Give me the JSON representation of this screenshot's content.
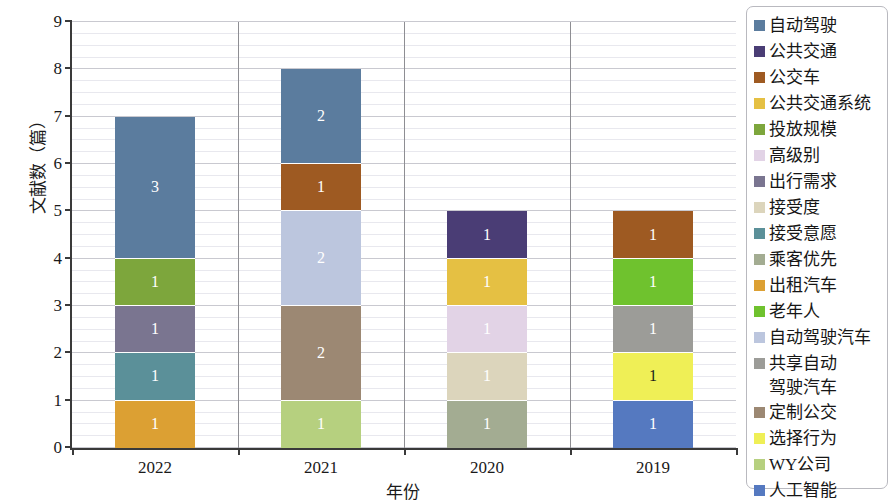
{
  "chart_data": {
    "type": "bar",
    "subtype": "stacked-bar",
    "title": "",
    "xlabel": "年份",
    "ylabel": "文献数（篇）",
    "categories": [
      "2022",
      "2021",
      "2020",
      "2019"
    ],
    "ylim": [
      0,
      9
    ],
    "ytick_labels": [
      "0",
      "1",
      "2",
      "3",
      "4",
      "5",
      "6",
      "7",
      "8",
      "9"
    ],
    "ytick_values": [
      0,
      1,
      2,
      3,
      4,
      5,
      6,
      7,
      8,
      9
    ],
    "grid": true,
    "minor_grid": true,
    "legend_position": "right",
    "totals": [
      7,
      8,
      5,
      5
    ],
    "series": [
      {
        "name": "自动驾驶",
        "color": "#5B7C9E",
        "values": [
          3,
          2,
          0,
          0
        ]
      },
      {
        "name": "公共交通",
        "color": "#4A3D75",
        "values": [
          0,
          0,
          1,
          0
        ]
      },
      {
        "name": "公交车",
        "color": "#9E5A22",
        "values": [
          0,
          1,
          0,
          1
        ]
      },
      {
        "name": "公共交通系统",
        "color": "#E5C043",
        "values": [
          0,
          0,
          1,
          0
        ]
      },
      {
        "name": "投放规模",
        "color": "#7DA63C",
        "values": [
          1,
          0,
          0,
          0
        ]
      },
      {
        "name": "高级别",
        "color": "#E2D3E6",
        "values": [
          0,
          0,
          1,
          0
        ]
      },
      {
        "name": "出行需求",
        "color": "#7A7590",
        "values": [
          1,
          0,
          0,
          0
        ]
      },
      {
        "name": "接受度",
        "color": "#DCD5BC",
        "values": [
          0,
          0,
          1,
          0
        ]
      },
      {
        "name": "接受意愿",
        "color": "#5B9099",
        "values": [
          1,
          0,
          0,
          0
        ]
      },
      {
        "name": "乘客优先",
        "color": "#A3AC92",
        "values": [
          0,
          0,
          1,
          0
        ]
      },
      {
        "name": "出租汽车",
        "color": "#DCA033",
        "values": [
          1,
          0,
          0,
          0
        ]
      },
      {
        "name": "老年人",
        "color": "#6FC22E",
        "values": [
          0,
          0,
          0,
          1
        ]
      },
      {
        "name": "自动驾驶汽车",
        "color": "#BCC6DE",
        "values": [
          0,
          2,
          0,
          0
        ]
      },
      {
        "name": "共享自动\n驾驶汽车",
        "color": "#9C9C98",
        "values": [
          0,
          0,
          0,
          1
        ]
      },
      {
        "name": "定制公交",
        "color": "#9C8873",
        "values": [
          0,
          2,
          0,
          0
        ]
      },
      {
        "name": "选择行为",
        "color": "#EFEF56",
        "values": [
          0,
          0,
          0,
          1
        ]
      },
      {
        "name": "WY公司",
        "color": "#B6D07F",
        "values": [
          0,
          1,
          0,
          0
        ]
      },
      {
        "name": "人工智能",
        "color": "#5579C0",
        "values": [
          0,
          0,
          0,
          1
        ]
      }
    ],
    "stacks": [
      {
        "category": "2022",
        "segments": [
          {
            "label": "1",
            "value": 1,
            "series": "出租汽车",
            "color": "#DCA033",
            "text_color": "#ffffff"
          },
          {
            "label": "1",
            "value": 1,
            "series": "接受意愿",
            "color": "#5B9099",
            "text_color": "#ffffff"
          },
          {
            "label": "1",
            "value": 1,
            "series": "出行需求",
            "color": "#7A7590",
            "text_color": "#ffffff"
          },
          {
            "label": "1",
            "value": 1,
            "series": "投放规模",
            "color": "#7DA63C",
            "text_color": "#ffffff"
          },
          {
            "label": "3",
            "value": 3,
            "series": "自动驾驶",
            "color": "#5B7C9E",
            "text_color": "#ffffff"
          }
        ]
      },
      {
        "category": "2021",
        "segments": [
          {
            "label": "1",
            "value": 1,
            "series": "WY公司",
            "color": "#B6D07F",
            "text_color": "#ffffff"
          },
          {
            "label": "2",
            "value": 2,
            "series": "定制公交",
            "color": "#9C8873",
            "text_color": "#ffffff"
          },
          {
            "label": "2",
            "value": 2,
            "series": "自动驾驶汽车",
            "color": "#BCC6DE",
            "text_color": "#ffffff"
          },
          {
            "label": "1",
            "value": 1,
            "series": "公交车",
            "color": "#9E5A22",
            "text_color": "#ffffff"
          },
          {
            "label": "2",
            "value": 2,
            "series": "自动驾驶",
            "color": "#5B7C9E",
            "text_color": "#ffffff"
          }
        ]
      },
      {
        "category": "2020",
        "segments": [
          {
            "label": "1",
            "value": 1,
            "series": "乘客优先",
            "color": "#A3AC92",
            "text_color": "#ffffff"
          },
          {
            "label": "1",
            "value": 1,
            "series": "接受度",
            "color": "#DCD5BC",
            "text_color": "#ffffff"
          },
          {
            "label": "1",
            "value": 1,
            "series": "高级别",
            "color": "#E2D3E6",
            "text_color": "#ffffff"
          },
          {
            "label": "1",
            "value": 1,
            "series": "公共交通系统",
            "color": "#E5C043",
            "text_color": "#ffffff"
          },
          {
            "label": "1",
            "value": 1,
            "series": "公共交通",
            "color": "#4A3D75",
            "text_color": "#ffffff"
          }
        ]
      },
      {
        "category": "2019",
        "segments": [
          {
            "label": "1",
            "value": 1,
            "series": "人工智能",
            "color": "#5579C0",
            "text_color": "#ffffff"
          },
          {
            "label": "1",
            "value": 1,
            "series": "选择行为",
            "color": "#EFEF56",
            "text_color": "#1b1b1b"
          },
          {
            "label": "1",
            "value": 1,
            "series": "共享自动驾驶汽车",
            "color": "#9C9C98",
            "text_color": "#ffffff"
          },
          {
            "label": "1",
            "value": 1,
            "series": "老年人",
            "color": "#6FC22E",
            "text_color": "#ffffff"
          },
          {
            "label": "1",
            "value": 1,
            "series": "公交车",
            "color": "#9E5A22",
            "text_color": "#ffffff"
          }
        ]
      }
    ]
  },
  "legend": {
    "items": [
      {
        "label": "自动驾驶",
        "color": "#5B7C9E"
      },
      {
        "label": "公共交通",
        "color": "#4A3D75"
      },
      {
        "label": "公交车",
        "color": "#9E5A22"
      },
      {
        "label": "公共交通系统",
        "color": "#E5C043"
      },
      {
        "label": "投放规模",
        "color": "#7DA63C"
      },
      {
        "label": "高级别",
        "color": "#E2D3E6"
      },
      {
        "label": "出行需求",
        "color": "#7A7590"
      },
      {
        "label": "接受度",
        "color": "#DCD5BC"
      },
      {
        "label": "接受意愿",
        "color": "#5B9099"
      },
      {
        "label": "乘客优先",
        "color": "#A3AC92"
      },
      {
        "label": "出租汽车",
        "color": "#DCA033"
      },
      {
        "label": "老年人",
        "color": "#6FC22E"
      },
      {
        "label": "自动驾驶汽车",
        "color": "#BCC6DE"
      },
      {
        "label": "共享自动\n驾驶汽车",
        "color": "#9C9C98"
      },
      {
        "label": "定制公交",
        "color": "#9C8873"
      },
      {
        "label": "选择行为",
        "color": "#EFEF56"
      },
      {
        "label": "WY公司",
        "color": "#B6D07F"
      },
      {
        "label": "人工智能",
        "color": "#5579C0"
      }
    ]
  },
  "axis": {
    "y_title": "文献数（篇）",
    "x_title": "年份"
  }
}
